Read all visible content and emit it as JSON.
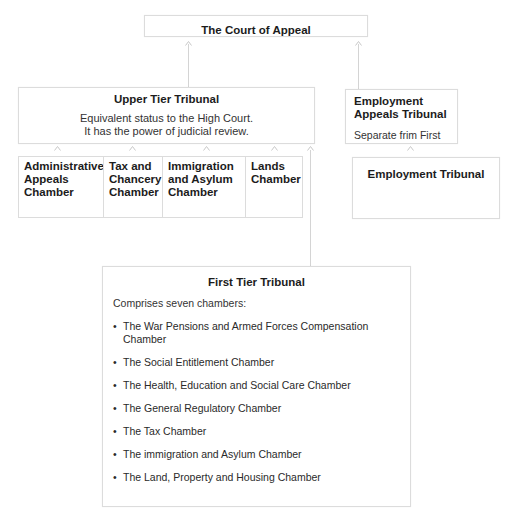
{
  "court_of_appeal": {
    "title": "The Court of Appeal"
  },
  "upper_tier": {
    "title": "Upper Tier Tribunal",
    "description_line1": "Equivalent status to the High Court.",
    "description_line2": "It has the power of judicial review."
  },
  "upper_chambers": [
    {
      "line1": "Administrative",
      "line2": "Appeals",
      "line3": "Chamber"
    },
    {
      "line1": "Tax and",
      "line2": "Chancery",
      "line3": "Chamber"
    },
    {
      "line1": "Immigration",
      "line2": "and Asylum",
      "line3": "Chamber"
    },
    {
      "line1": "Lands",
      "line2": "Chamber",
      "line3": ""
    }
  ],
  "employment_appeals": {
    "title_line1": "Employment",
    "title_line2": "Appeals Tribunal",
    "note": "Separate frim First"
  },
  "employment_tribunal": {
    "title": "Employment Tribunal"
  },
  "first_tier": {
    "title": "First Tier Tribunal",
    "intro": "Comprises seven chambers:",
    "bullet": "•",
    "chambers": [
      {
        "line1": "The War Pensions and Armed Forces Compensation",
        "line2": "Chamber"
      },
      {
        "line1": "The Social Entitlement Chamber"
      },
      {
        "line1": "The Health, Education and Social Care Chamber"
      },
      {
        "line1": "The General Regulatory Chamber"
      },
      {
        "line1": "The Tax Chamber"
      },
      {
        "line1": "The immigration and Asylum Chamber"
      },
      {
        "line1": "The Land, Property and Housing Chamber"
      }
    ]
  },
  "colors": {
    "border": "#dcdcdc",
    "connector": "#d4d4d4",
    "text": "#1c1c1c"
  }
}
